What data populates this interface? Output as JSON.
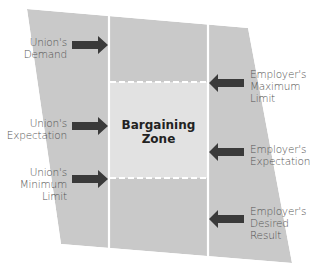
{
  "diagram": {
    "title": "Bargaining Zone",
    "zone_label_line1": "Bargaining",
    "zone_label_line2": "Zone",
    "colors": {
      "shape_fill": "#c9c9c9",
      "zone_fill": "#e2e2e2",
      "arrow": "#3a3a3a",
      "divider": "#ffffff",
      "text": "#555555"
    },
    "union_labels": [
      {
        "line1": "Union's",
        "line2": "Demand",
        "line3": ""
      },
      {
        "line1": "Union's",
        "line2": "Expectation",
        "line3": ""
      },
      {
        "line1": "Union's",
        "line2": "Minimum",
        "line3": "Limit"
      }
    ],
    "employer_labels": [
      {
        "line1": "Employer's",
        "line2": "Maximum",
        "line3": "Limit"
      },
      {
        "line1": "Employer's",
        "line2": "Expectation",
        "line3": ""
      },
      {
        "line1": "Employer's",
        "line2": "Desired",
        "line3": "Result"
      }
    ]
  }
}
